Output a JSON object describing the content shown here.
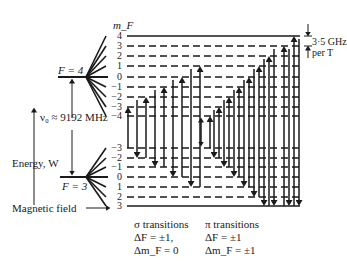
{
  "diagram": {
    "mf_header": "m_F",
    "upper_level": {
      "label": "F = 4",
      "mf_values": [
        "4",
        "3",
        "2",
        "1",
        "0",
        "−1",
        "−2",
        "−3",
        "−4"
      ]
    },
    "lower_level": {
      "label": "F = 3",
      "mf_values": [
        "−3",
        "−2",
        "−1",
        "0",
        "1",
        "2",
        "3"
      ]
    },
    "splitting_label": "ν₀ ≈ 9192 MHz",
    "energy_axis_label": "Energy, W",
    "field_label": "Magnetic field",
    "zeeman_rate_line1": "3·5 GHz",
    "zeeman_rate_line2": "per T",
    "sigma": {
      "title": "σ transitions",
      "rule1": "ΔF = ±1,",
      "rule2": "Δm_F = 0"
    },
    "pi": {
      "title": "π transitions",
      "rule1": "ΔF = ±1",
      "rule2": "Δm_F = ±1"
    }
  },
  "colors": {
    "ink": "#1a1a1a",
    "background": "#ffffff"
  }
}
